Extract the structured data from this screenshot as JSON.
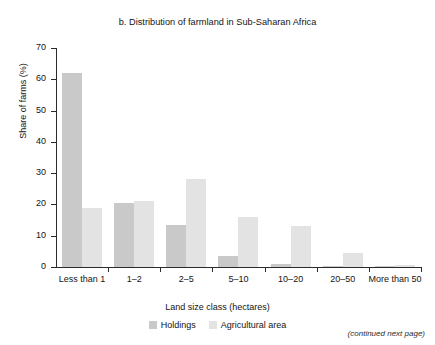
{
  "chart_data": {
    "type": "bar",
    "title": "b. Distribution of farmland in Sub-Saharan Africa",
    "xlabel": "Land size class (hectares)",
    "ylabel": "Share of farms (%)",
    "ylim": [
      0,
      70
    ],
    "yticks": [
      0,
      10,
      20,
      30,
      40,
      50,
      60,
      70
    ],
    "grid": false,
    "legend_position": "bottom-center",
    "categories": [
      "Less than 1",
      "1–2",
      "2–5",
      "5–10",
      "10–20",
      "20–50",
      "More than 50"
    ],
    "series": [
      {
        "name": "Holdings",
        "color": "#c9c9c9",
        "values": [
          62.0,
          20.5,
          13.5,
          3.5,
          1.0,
          0.4,
          0.3
        ]
      },
      {
        "name": "Agricultural area",
        "color": "#e3e3e3",
        "values": [
          19.0,
          21.0,
          28.0,
          16.0,
          13.0,
          4.5,
          0.8
        ]
      }
    ]
  },
  "footnote": "(continued next page)"
}
